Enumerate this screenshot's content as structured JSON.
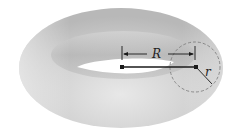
{
  "diagram": {
    "labels": {
      "major_radius": "R",
      "minor_radius": "r"
    },
    "colors": {
      "surface_light": "#e6e6e6",
      "surface_mid": "#c4c4c4",
      "surface_dark": "#a8a8a8",
      "line": "#1a1a1a",
      "dashed_circle": "#777777",
      "background": "#ffffff"
    }
  }
}
